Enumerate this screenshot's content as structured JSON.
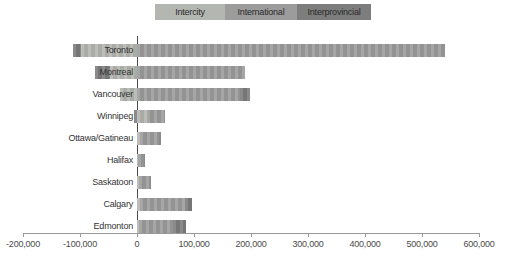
{
  "legend": {
    "items": [
      {
        "label": "Intercity",
        "color": "#b4b6b1",
        "width": 70
      },
      {
        "label": "International",
        "color": "#9c9c9c",
        "width": 72
      },
      {
        "label": "Interprovincial",
        "color": "#7d7d7d",
        "width": 74
      }
    ]
  },
  "axis": {
    "ticks": [
      {
        "label": "-200,000",
        "value": -200000
      },
      {
        "label": "-100,000",
        "value": -100000
      },
      {
        "label": "0",
        "value": 0
      },
      {
        "label": "100,000",
        "value": 100000
      },
      {
        "label": "200,000",
        "value": 200000
      },
      {
        "label": "300,000",
        "value": 300000
      },
      {
        "label": "400,000",
        "value": 400000
      },
      {
        "label": "500,000",
        "value": 500000
      },
      {
        "label": "600,000",
        "value": 600000
      }
    ]
  },
  "chart_data": {
    "type": "bar",
    "orientation": "horizontal",
    "stacked": true,
    "categories": [
      "Toronto",
      "Montreal",
      "Vancouver",
      "Winnipeg",
      "Ottawa/Gatineau",
      "Halifax",
      "Saskatoon",
      "Calgary",
      "Edmonton"
    ],
    "series": [
      {
        "name": "Intercity",
        "color": "#b4b6b1",
        "values": [
          -98000,
          -47000,
          -30000,
          17000,
          5000,
          2000,
          3000,
          5000,
          4000
        ]
      },
      {
        "name": "International",
        "color": "#9c9c9c",
        "values": [
          540000,
          189000,
          180000,
          32000,
          33000,
          10000,
          19000,
          79000,
          59000
        ]
      },
      {
        "name": "Interprovincial",
        "color": "#7d7d7d",
        "values": [
          -14000,
          -26000,
          18000,
          -5000,
          4000,
          2000,
          2000,
          12000,
          23000
        ]
      }
    ],
    "title": "",
    "xlabel": "",
    "ylabel": "",
    "xlim": [
      -200000,
      600000
    ],
    "x_tick_interval": 100000,
    "legend_position": "top",
    "grid": false
  }
}
